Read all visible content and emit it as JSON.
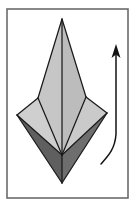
{
  "figure": {
    "canvas": {
      "width": 137,
      "height": 213,
      "background": "#ffffff"
    },
    "frame": {
      "name": "diagram-border",
      "x": 7,
      "y": 9,
      "width": 121,
      "height": 189,
      "stroke": "#6b6b6b",
      "stroke_width": 1.6,
      "fill": "#ffffff"
    },
    "palette": {
      "paper_light": "#c6c6c6",
      "paper_mid": "#b9b9b9",
      "paper_pale": "#cfcfcf",
      "paper_dark": "#5f5f5f",
      "paper_dark_shade": "#6e6e6e",
      "outline": "#1a1a1a",
      "arrow": "#141414",
      "frame": "#6b6b6b",
      "background": "#ffffff"
    },
    "geometry": {
      "apex": {
        "x": 62,
        "y": 19
      },
      "left_point": {
        "x": 17,
        "y": 115
      },
      "right_point": {
        "x": 107,
        "y": 113
      },
      "bottom_tip": {
        "x": 62,
        "y": 183
      },
      "center_vertex": {
        "x": 62,
        "y": 155
      },
      "left_shoulder": {
        "x": 38,
        "y": 98
      },
      "right_shoulder": {
        "x": 86,
        "y": 97
      }
    },
    "facets": [
      {
        "name": "facet-upper-left",
        "fill": "#c6c6c6",
        "points": "62,19 38,98 62,155"
      },
      {
        "name": "facet-upper-right",
        "fill": "#bcbcbc",
        "points": "62,19 86,97 62,155"
      },
      {
        "name": "facet-left-flap",
        "fill": "#cfcfcf",
        "points": "38,98 17,115 62,155"
      },
      {
        "name": "facet-right-flap",
        "fill": "#cacaca",
        "points": "86,97 107,113 62,155"
      },
      {
        "name": "facet-lower-left-dark",
        "fill": "#5f5f5f",
        "points": "17,115 62,155 62,183"
      },
      {
        "name": "facet-lower-right-dark",
        "fill": "#6e6e6e",
        "points": "107,113 62,155 62,183"
      }
    ],
    "creases": [
      {
        "name": "crease-center-spine",
        "path": "M62,19 L62,155"
      },
      {
        "name": "crease-left-edge",
        "path": "M62,19 L38,98"
      },
      {
        "name": "crease-right-edge",
        "path": "M62,19 L86,97"
      },
      {
        "name": "crease-left-inner",
        "path": "M38,98 L62,155"
      },
      {
        "name": "crease-right-inner",
        "path": "M86,97 L62,155"
      },
      {
        "name": "crease-left-flap-fold",
        "path": "M38,98 L17,115"
      },
      {
        "name": "crease-right-flap-fold",
        "path": "M86,97 L107,113"
      },
      {
        "name": "crease-left-lower",
        "path": "M17,115 L62,155"
      },
      {
        "name": "crease-right-lower",
        "path": "M107,113 L62,155"
      },
      {
        "name": "crease-bottom-left",
        "path": "M17,115 L62,183"
      },
      {
        "name": "crease-bottom-right",
        "path": "M107,113 L62,183"
      },
      {
        "name": "crease-bottom-notch",
        "path": "M62,155 L62,183"
      }
    ],
    "arrow": {
      "name": "motion-arrow",
      "label": "upward fold motion",
      "shaft_path": "M101,164 C107,157 115,150 116,134 L116,54",
      "head_points": "116,44 120.5,58 116,54.5 111.5,58",
      "stroke": "#141414",
      "stroke_width": 1.5,
      "direction": "up"
    }
  }
}
